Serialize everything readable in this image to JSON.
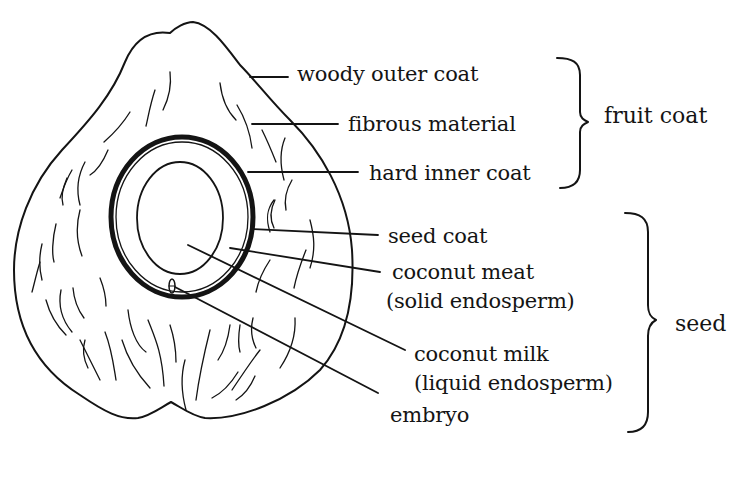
{
  "diagram": {
    "labels": {
      "woody_outer_coat": "woody outer coat",
      "fibrous_material": "fibrous material",
      "hard_inner_coat": "hard inner coat",
      "seed_coat": "seed coat",
      "coconut_meat": "coconut meat",
      "coconut_meat_sub": "(solid endosperm)",
      "coconut_milk": "coconut milk",
      "coconut_milk_sub": "(liquid endosperm)",
      "embryo": "embryo"
    },
    "groups": {
      "fruit_coat": "fruit coat",
      "seed": "seed"
    },
    "colors": {
      "ink": "#141414",
      "background": "#ffffff"
    }
  }
}
